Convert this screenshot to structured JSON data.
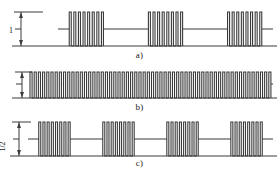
{
  "figure": {
    "type": "waveform-diagram",
    "stroke_color": "#3a3a3a",
    "background_color": "#ffffff"
  },
  "panels": [
    {
      "id": "a",
      "caption": "a)",
      "amplitude_label": "1",
      "axis": {
        "baseline_y": 0,
        "mid_level": 0.5,
        "peak_level": 1.0
      },
      "waveform": {
        "kind": "burst-train",
        "bursts": 3,
        "pulses_per_burst": 8,
        "idle_level": 0.5,
        "pulse_top": 1.0,
        "pulse_bottom": 0.0
      }
    },
    {
      "id": "b",
      "caption": "b)",
      "amplitude_label": "1/2",
      "axis": {
        "baseline_y": 0,
        "mid_level": 0.5,
        "peak_level": 1.0
      },
      "waveform": {
        "kind": "continuous-train",
        "bursts": 1,
        "pulses_per_burst": 58,
        "idle_level": 0.5,
        "pulse_top": 1.0,
        "pulse_bottom": 0.0
      }
    },
    {
      "id": "c",
      "caption": "c)",
      "amplitude_label": "1",
      "axis": {
        "baseline_y": 0,
        "mid_level": 0.5,
        "peak_level": 1.0
      },
      "waveform": {
        "kind": "burst-train",
        "bursts": 4,
        "pulses_per_burst": 8,
        "idle_level": 0.5,
        "pulse_top": 1.0,
        "pulse_bottom": 0.0
      }
    }
  ],
  "chart_data": {
    "type": "line",
    "title": "",
    "xlabel": "",
    "ylabel": "",
    "grid": false,
    "legend": "none",
    "series": [
      {
        "name": "a)",
        "panel": "a",
        "ylim": [
          0,
          1
        ],
        "amplitude": 1,
        "burst_count": 3,
        "pulses_per_burst": 8,
        "duty_pattern": "8 narrow full-amplitude pulses, then mid-level idle gap, repeated 3 times"
      },
      {
        "name": "b)",
        "panel": "b",
        "ylim": [
          0,
          0.5
        ],
        "amplitude": 0.5,
        "burst_count": 1,
        "pulses_per_burst": 58,
        "duty_pattern": "uninterrupted dense pulse train spanning full width at half amplitude"
      },
      {
        "name": "c)",
        "panel": "c",
        "ylim": [
          0,
          1
        ],
        "amplitude": 1,
        "burst_count": 4,
        "pulses_per_burst": 8,
        "duty_pattern": "8 narrow full-amplitude pulses, then mid-level idle gap, repeated 4 times"
      }
    ]
  }
}
